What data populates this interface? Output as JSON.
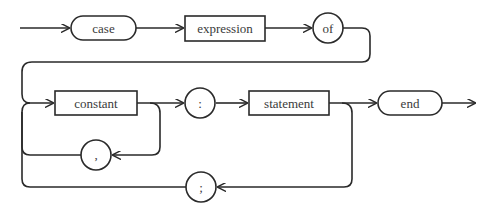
{
  "diagram": {
    "colors": {
      "stroke": "#2a2a2a",
      "text": "#3a3a3a",
      "background": "#ffffff"
    },
    "nodes": {
      "case": {
        "label": "case",
        "shape": "rounded-terminal"
      },
      "expression": {
        "label": "expression",
        "shape": "rectangle-nonterminal"
      },
      "of": {
        "label": "of",
        "shape": "circle-terminal"
      },
      "constant": {
        "label": "constant",
        "shape": "rectangle-nonterminal"
      },
      "colon": {
        "label": ":",
        "shape": "circle-terminal"
      },
      "statement": {
        "label": "statement",
        "shape": "rectangle-nonterminal"
      },
      "end": {
        "label": "end",
        "shape": "rounded-terminal"
      },
      "comma": {
        "label": ",",
        "shape": "circle-terminal"
      },
      "semicolon": {
        "label": ";",
        "shape": "circle-terminal"
      }
    },
    "flow": [
      "entry -> case",
      "case -> expression",
      "expression -> of",
      "of -> constant",
      "constant -> colon",
      "constant -> comma (loop back)",
      "comma -> constant",
      "colon -> statement",
      "statement -> end",
      "statement -> semicolon (loop back)",
      "semicolon -> constant",
      "end -> exit"
    ]
  }
}
